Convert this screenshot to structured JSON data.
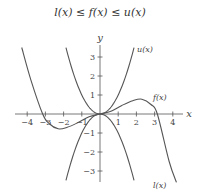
{
  "chart_data": {
    "type": "line",
    "title": "l(x) ≤ f(x) ≤ u(x)",
    "xlabel": "x",
    "ylabel": "y",
    "xlim": [
      -4.5,
      4.5
    ],
    "ylim": [
      -3.7,
      3.7
    ],
    "x_ticks": [
      -4,
      -3,
      -2,
      -1,
      1,
      2,
      3,
      4
    ],
    "y_ticks": [
      -3,
      -2,
      -1,
      1,
      2,
      3
    ],
    "grid": false,
    "series": [
      {
        "name": "u(x)",
        "label": "u(x)",
        "formula": "x^2",
        "x": [
          -1.87,
          -1.5,
          -1,
          -0.5,
          0,
          0.5,
          1,
          1.5,
          1.87
        ],
        "y": [
          3.5,
          2.25,
          1,
          0.25,
          0,
          0.25,
          1,
          2.25,
          3.5
        ]
      },
      {
        "name": "l(x)",
        "label": "l(x)",
        "formula": "-x^2",
        "x": [
          -1.87,
          -1.5,
          -1,
          -0.5,
          0,
          0.5,
          1,
          1.5,
          1.87
        ],
        "y": [
          -3.5,
          -2.25,
          -1,
          -0.25,
          0,
          -0.25,
          -1,
          -2.25,
          -3.5
        ]
      },
      {
        "name": "f(x)",
        "label": "f(x)",
        "x": [
          -4.3,
          -3.8,
          -3.15,
          -2.8,
          -2.3,
          -1.8,
          -1.2,
          -0.6,
          0,
          0.6,
          1.2,
          1.8,
          2.3,
          2.8,
          3.15,
          3.8,
          4.2
        ],
        "y": [
          3.5,
          1.8,
          0,
          -0.5,
          -0.78,
          -0.7,
          -0.45,
          -0.15,
          0,
          0.15,
          0.45,
          0.7,
          0.78,
          0.5,
          0,
          -2.5,
          -3.6
        ]
      }
    ]
  },
  "labels": {
    "title": "l(x) ≤ f(x) ≤ u(x)",
    "x_axis": "x",
    "y_axis": "y",
    "u": "u(x)",
    "f": "f(x)",
    "l": "l(x)"
  },
  "ticks": {
    "x": [
      "−4",
      "−3",
      "−2",
      "−1",
      "1",
      "2",
      "3",
      "4"
    ],
    "y": [
      "3",
      "2",
      "1",
      "−1",
      "−2",
      "−3"
    ]
  }
}
